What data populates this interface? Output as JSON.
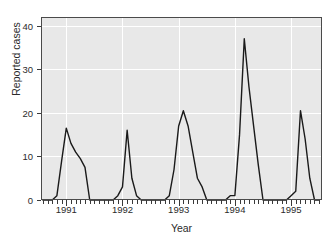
{
  "axes": {
    "xlabel": "Year",
    "ylabel": "Reported cases",
    "y_ticks": [
      "0",
      "10",
      "20",
      "30",
      "40"
    ],
    "x_ticks": [
      "1991",
      "1992",
      "1993",
      "1994",
      "1995"
    ]
  },
  "style": {
    "panel_bg": "#e8e8e8",
    "grid_color": "#ffffff",
    "line_color": "#1a1a1a",
    "axis_color": "#3a3a3a",
    "text_color": "#2b2b2b"
  },
  "chart_data": {
    "type": "line",
    "title": "",
    "xlabel": "Year",
    "ylabel": "Reported cases",
    "xlim": [
      1990.55,
      1995.55
    ],
    "ylim": [
      0,
      42
    ],
    "y_ticks": [
      0,
      10,
      20,
      30,
      40
    ],
    "x_ticks": [
      1991,
      1992,
      1993,
      1994,
      1995
    ],
    "grid": true,
    "legend": "none",
    "x_units": "months",
    "x": [
      1990.583,
      1990.667,
      1990.75,
      1990.833,
      1990.917,
      1991.0,
      1991.083,
      1991.167,
      1991.25,
      1991.333,
      1991.417,
      1991.5,
      1991.583,
      1991.667,
      1991.75,
      1991.833,
      1991.917,
      1992.0,
      1992.083,
      1992.167,
      1992.25,
      1992.333,
      1992.417,
      1992.5,
      1992.583,
      1992.667,
      1992.75,
      1992.833,
      1992.917,
      1993.0,
      1993.083,
      1993.167,
      1993.25,
      1993.333,
      1993.417,
      1993.5,
      1993.583,
      1993.667,
      1993.75,
      1993.833,
      1993.917,
      1994.0,
      1994.083,
      1994.167,
      1994.25,
      1994.333,
      1994.417,
      1994.5,
      1994.583,
      1994.667,
      1994.75,
      1994.833,
      1994.917,
      1995.0,
      1995.083,
      1995.167,
      1995.25,
      1995.333,
      1995.417,
      1995.5
    ],
    "y": [
      0,
      0,
      0,
      1,
      9,
      16.5,
      13,
      11,
      9.5,
      7.5,
      0,
      0,
      0,
      0,
      0,
      0,
      1,
      3,
      16,
      5,
      1,
      0,
      0,
      0,
      0,
      0,
      0,
      1,
      7,
      17,
      20.5,
      17,
      11,
      5,
      3,
      0,
      0,
      0,
      0,
      0,
      1,
      1,
      15,
      37,
      26,
      17,
      8,
      0,
      0,
      0,
      0,
      0,
      0,
      1,
      2,
      20.5,
      14,
      5,
      0,
      0
    ],
    "peaks": [
      {
        "year": 1991,
        "value": 16.5
      },
      {
        "year": 1992,
        "value": 16.0
      },
      {
        "year": 1993,
        "value": 20.5
      },
      {
        "year": 1994,
        "value": 37.0
      },
      {
        "year": 1995,
        "value": 20.5
      }
    ]
  }
}
